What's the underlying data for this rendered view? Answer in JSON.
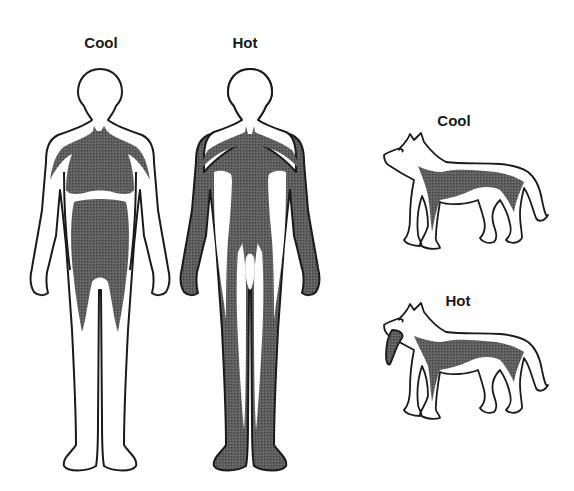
{
  "labels": {
    "human_cool": "Cool",
    "human_hot": "Hot",
    "dog_cool": "Cool",
    "dog_hot": "Hot"
  },
  "colors": {
    "outline": "#1a1a1a",
    "blood": "#5a5a5a",
    "body": "#ffffff",
    "background": "#ffffff"
  },
  "figures": [
    {
      "subject": "human",
      "condition": "Cool",
      "description": "blood concentrated in core (torso), limbs pale"
    },
    {
      "subject": "human",
      "condition": "Hot",
      "description": "blood shunted to skin and limbs"
    },
    {
      "subject": "dog",
      "condition": "Cool",
      "description": "blood in core, mouth closed"
    },
    {
      "subject": "dog",
      "condition": "Hot",
      "description": "panting with tongue out, blood to tongue"
    }
  ]
}
